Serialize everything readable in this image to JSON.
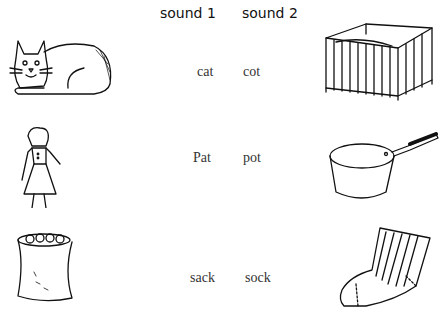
{
  "headers": {
    "col1": "sound 1",
    "col2": "sound 2"
  },
  "rows": [
    {
      "sound1": "cat",
      "sound2": "cot",
      "left_picture": "cat-icon",
      "right_picture": "cot-icon"
    },
    {
      "sound1": "Pat",
      "sound2": "pot",
      "left_picture": "girl-icon",
      "right_picture": "saucepan-icon"
    },
    {
      "sound1": "sack",
      "sound2": "sock",
      "left_picture": "sack-icon",
      "right_picture": "sock-icon"
    }
  ]
}
